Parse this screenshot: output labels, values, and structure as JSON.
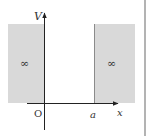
{
  "diagram": {
    "type": "infinite-square-well-potential",
    "labels": {
      "y_axis": "V",
      "x_axis": "x",
      "origin": "O",
      "well_edge": "a",
      "left_region": "∞",
      "right_region": "∞"
    },
    "colors": {
      "shade": "#d9d9d9",
      "axis": "#222222",
      "frame": "#9a9a9a",
      "wall_edge": "#777777",
      "background": "#ffffff"
    }
  }
}
